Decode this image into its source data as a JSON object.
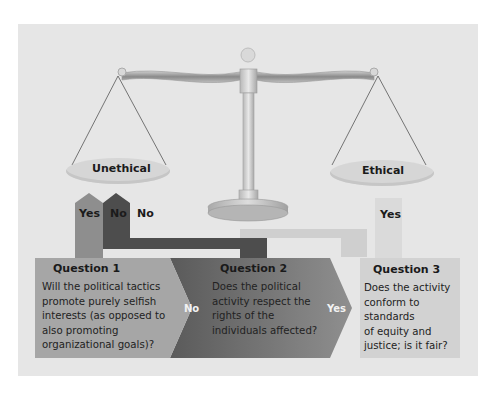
{
  "figure": {
    "scale": {
      "left_pan_label": "Unethical",
      "right_pan_label": "Ethical"
    },
    "arrows": {
      "yes_to_unethical": "Yes",
      "no_to_unethical": "No",
      "no_to_unethical_outline": "No",
      "yes_to_ethical": "Yes"
    },
    "questions": [
      {
        "title": "Question 1",
        "text": "Will the political tactics promote purely selfish interests (as opposed to also promoting organizational goals)?",
        "lines": [
          "Will the political tactics",
          "promote purely selfish",
          "interests (as opposed to",
          "also promoting",
          "organizational goals)?"
        ],
        "exit_label": "No"
      },
      {
        "title": "Question 2",
        "text": "Does the political activity respect the rights of the individuals affected?",
        "lines": [
          "Does the political",
          "activity respect the",
          "rights of the",
          "individuals affected?"
        ],
        "exit_label": "Yes"
      },
      {
        "title": "Question 3",
        "text": "Does the activity conform to standards of equity and justice; is it fair?",
        "lines": [
          "Does the activity",
          "conform to",
          "standards",
          "of equity and",
          "justice; is it fair?"
        ]
      }
    ],
    "colors": {
      "background": "#e6e6e6",
      "q1_fill": "#a3a3a3",
      "q2_fill": "#7a7a7a",
      "q3_fill": "#d2d2d2",
      "dark_arrow": "#4a4a4a",
      "mid_arrow": "#8c8c8c",
      "light_arrow": "#cfcfcf"
    }
  }
}
